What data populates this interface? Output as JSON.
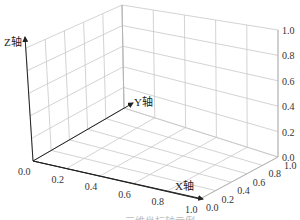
{
  "chart_data": {
    "type": "scatter",
    "subtype": "3d-empty-axes",
    "title": "",
    "xlabel": "X轴",
    "ylabel": "Y轴",
    "zlabel": "Z轴",
    "xlim": [
      0.0,
      1.0
    ],
    "ylim": [
      0.0,
      1.0
    ],
    "zlim": [
      0.0,
      1.0
    ],
    "x_ticks": [
      "0.0",
      "0.2",
      "0.4",
      "0.6",
      "0.8",
      "1.0"
    ],
    "y_ticks": [
      "0.0",
      "0.2",
      "0.4",
      "0.6",
      "0.8",
      "1.0"
    ],
    "z_ticks": [
      "0.0",
      "0.2",
      "0.4",
      "0.6",
      "0.8",
      "1.0"
    ],
    "grid": true,
    "series": []
  },
  "labels": {
    "x_axis": "X轴",
    "y_axis": "Y轴",
    "z_axis": "Z轴"
  },
  "caption": "……三维坐标轴示例"
}
